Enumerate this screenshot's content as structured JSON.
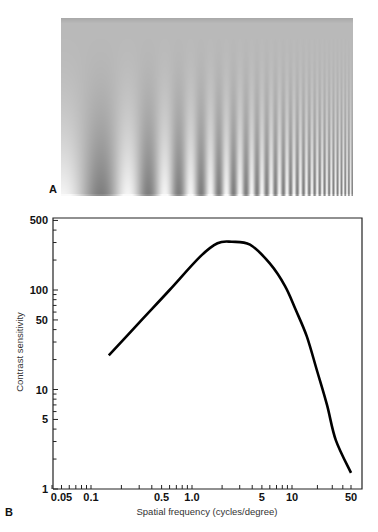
{
  "panel_a": {
    "letter": "A",
    "description": "Sinusoidal grating with spatial frequency increasing left to right and contrast decreasing bottom to top",
    "colors": {
      "mid": "#b9b9b9",
      "light": "#f4f4f4",
      "dark": "#7f7f7f",
      "top_band": "#a9a9a9"
    }
  },
  "panel_b": {
    "letter": "B"
  },
  "chart_data": {
    "type": "line",
    "title": "",
    "xlabel": "Spatial frequency (cycles/degree)",
    "ylabel": "Contrast sensitivity",
    "xscale": "log",
    "yscale": "log",
    "xlim": [
      0.04,
      60
    ],
    "ylim": [
      1,
      500
    ],
    "grid": false,
    "legend": null,
    "x_ticks": [
      {
        "value": 0.05,
        "label": "0.05"
      },
      {
        "value": 0.1,
        "label": "0.1"
      },
      {
        "value": 0.5,
        "label": "0.5"
      },
      {
        "value": 1.0,
        "label": "1.0"
      },
      {
        "value": 5,
        "label": "5"
      },
      {
        "value": 10,
        "label": "10"
      },
      {
        "value": 50,
        "label": "50"
      }
    ],
    "y_ticks": [
      {
        "value": 1,
        "label": "1"
      },
      {
        "value": 5,
        "label": "5"
      },
      {
        "value": 10,
        "label": "10"
      },
      {
        "value": 50,
        "label": "50"
      },
      {
        "value": 100,
        "label": "100"
      },
      {
        "value": 500,
        "label": "500"
      }
    ],
    "series": [
      {
        "name": "Contrast sensitivity function",
        "color": "#000000",
        "x": [
          0.15,
          0.3,
          0.6,
          1.2,
          1.8,
          2.5,
          3.8,
          6.0,
          8.5,
          11,
          15,
          20,
          26,
          33,
          50
        ],
        "y": [
          22,
          47,
          100,
          215,
          295,
          305,
          285,
          185,
          110,
          64,
          34,
          15,
          7,
          3.1,
          1.45
        ]
      }
    ]
  }
}
